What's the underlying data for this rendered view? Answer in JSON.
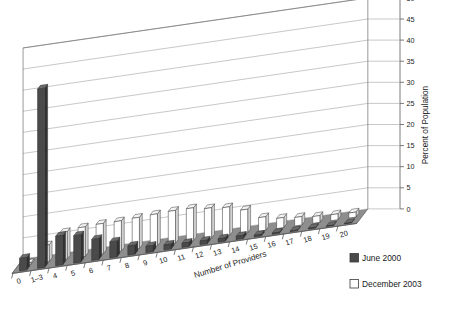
{
  "chart_data": {
    "type": "bar",
    "title": "",
    "xlabel": "Number of Providers",
    "ylabel": "Percent of Population",
    "ylim": [
      0,
      50
    ],
    "ytick_step": 5,
    "yticks": [
      "0",
      "5",
      "10",
      "15",
      "20",
      "25",
      "30",
      "35",
      "40",
      "45",
      "50"
    ],
    "grid": true,
    "projection": "3d",
    "legend_position": "bottom-right",
    "categories": [
      "0",
      "1–3",
      "4",
      "5",
      "6",
      "7",
      "8",
      "9",
      "10",
      "11",
      "12",
      "13",
      "14",
      "15",
      "16",
      "17",
      "18",
      "19",
      "20"
    ],
    "series": [
      {
        "name": "June 2000",
        "color": "#4a4a4a",
        "values": [
          3.0,
          42.5,
          7.0,
          6.5,
          5.0,
          3.8,
          2.2,
          1.5,
          1.2,
          1.0,
          0.9,
          0.8,
          0.8,
          0.4,
          0.3,
          0.2,
          0.2,
          0.1,
          0.1
        ]
      },
      {
        "name": "December 2003",
        "color": "#ffffff",
        "values": [
          0.4,
          4.0,
          6.5,
          7.0,
          7.2,
          7.2,
          7.4,
          7.6,
          7.8,
          7.8,
          7.2,
          6.8,
          5.6,
          3.2,
          2.4,
          2.0,
          1.6,
          1.4,
          1.2
        ]
      }
    ]
  },
  "legend": {
    "items": [
      {
        "label": "June 2000",
        "swatch": "#4a4a4a"
      },
      {
        "label": "December 2003",
        "swatch": "#ffffff"
      }
    ]
  },
  "axes": {
    "y_title": "Percent of Population",
    "x_title": "Number of Providers"
  }
}
